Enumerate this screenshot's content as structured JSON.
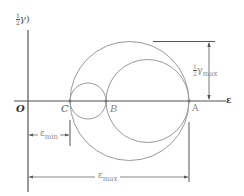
{
  "diagram": {
    "y_axis_label": {
      "frac": [
        "1",
        "2"
      ],
      "symbol": "γ",
      "paren": ")"
    },
    "x_axis_label": "ε",
    "origin_label": "O",
    "points": [
      {
        "label": "C",
        "x": 70
      },
      {
        "label": "B",
        "x": 106
      },
      {
        "label": "A",
        "x": 189
      }
    ],
    "gamma_max_label": {
      "frac": [
        "1",
        "2"
      ],
      "symbol": "γ",
      "sub": "max"
    },
    "eps_min_label": {
      "symbol": "ε",
      "sub": "min"
    },
    "eps_max_label": {
      "symbol": "ε",
      "sub": "max"
    },
    "colors": {
      "axis": "#555555",
      "circle": "#9a9a9a",
      "text": "#555555"
    }
  }
}
